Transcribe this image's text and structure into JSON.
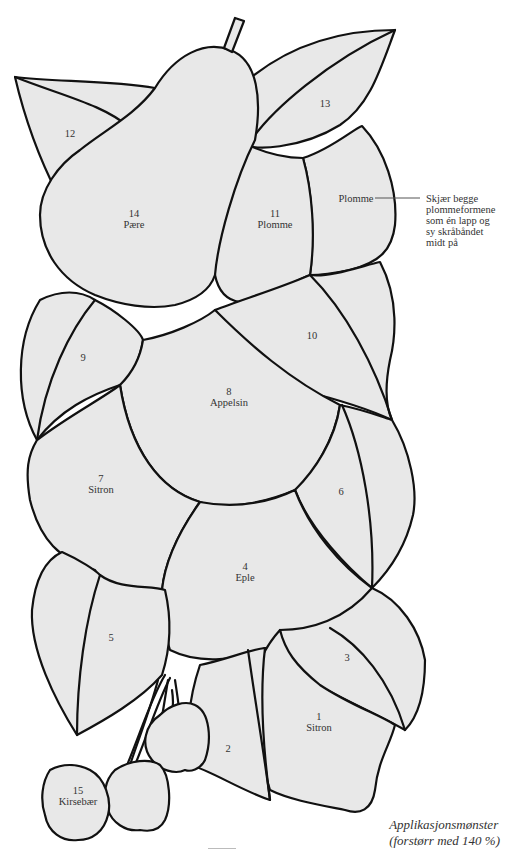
{
  "diagram": {
    "type": "applique-pattern",
    "pieces": [
      {
        "number": "1",
        "name": "Sitron"
      },
      {
        "number": "2",
        "name": ""
      },
      {
        "number": "3",
        "name": ""
      },
      {
        "number": "4",
        "name": "Eple"
      },
      {
        "number": "5",
        "name": ""
      },
      {
        "number": "6",
        "name": ""
      },
      {
        "number": "7",
        "name": "Sitron"
      },
      {
        "number": "8",
        "name": "Appelsin"
      },
      {
        "number": "9",
        "name": ""
      },
      {
        "number": "10",
        "name": ""
      },
      {
        "number": "11",
        "name": "Plomme"
      },
      {
        "number": "12",
        "name": ""
      },
      {
        "number": "13",
        "name": ""
      },
      {
        "number": "14",
        "name": "Pære"
      },
      {
        "number": "15",
        "name": "Kirsebær"
      }
    ],
    "extra_label": "Plomme",
    "note_lines": [
      "Skjær begge",
      "plommeformene",
      "som én lapp og",
      "sy skråbåndet",
      "midt på"
    ],
    "caption_lines": [
      "Applikasjonsmønster",
      "(forstørr med 140 %)"
    ],
    "colors": {
      "fill": "#e8e8e8",
      "outline": "#111111",
      "background": "#ffffff"
    }
  }
}
